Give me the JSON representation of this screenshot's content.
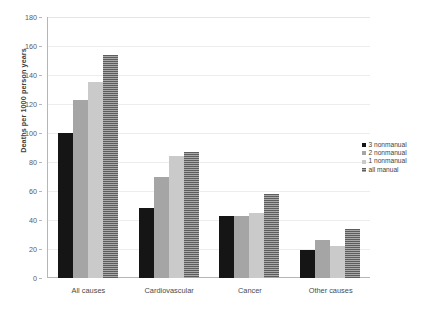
{
  "chart_data": {
    "type": "bar",
    "title": "",
    "subtitle": "",
    "xlabel": "",
    "ylabel": "Deaths per 1000 person years",
    "categories": [
      "All causes",
      "Cardiovascular",
      "Cancer",
      "Other causes"
    ],
    "series": [
      {
        "name": "3 nonmanual",
        "values": [
          100,
          48,
          43,
          19
        ]
      },
      {
        "name": "2 nonmanual",
        "values": [
          123,
          70,
          43,
          26
        ]
      },
      {
        "name": "1 nonmanual",
        "values": [
          135,
          84,
          45,
          22
        ]
      },
      {
        "name": "all manual",
        "values": [
          154,
          87,
          58,
          34
        ]
      }
    ],
    "ylim": [
      0,
      180
    ],
    "yticks": [
      0,
      20,
      40,
      60,
      80,
      100,
      120,
      140,
      160,
      180
    ],
    "grid": true,
    "legend_position": "right",
    "colors": {
      "series_1": "#151515",
      "series_2": "#a5a5a5",
      "series_3": "#cacaca",
      "series_4": "#8d8d8d",
      "gridline": "#ededed",
      "axis": "#b6b6b6",
      "text": "#3f3f3f",
      "background": "#ffffff"
    }
  }
}
